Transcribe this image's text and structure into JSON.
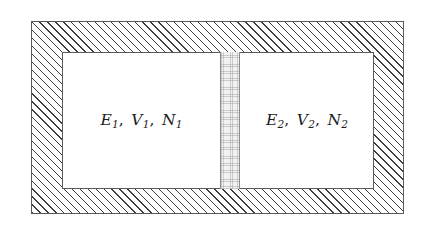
{
  "figure": {
    "background_color": "#ffffff"
  },
  "outer_wall": {
    "name": "insulating outer wall",
    "fill_pattern": "diagonal-hatch-45deg",
    "hatch_color": "#3d3d3d",
    "border_color": "#5a5a5a"
  },
  "inner_cavity": {
    "name": "inner cavity",
    "fill_color": "#ffffff",
    "border_color": "#5a5a5a"
  },
  "partition": {
    "name": "central partition",
    "fill_pattern": "stipple",
    "fill_color": "#f2f2f2",
    "border_color": "#8c8c8c"
  },
  "chambers": [
    {
      "id": "subsystem-1",
      "energy": "E",
      "energy_sub": "1",
      "volume": "V",
      "volume_sub": "1",
      "particles": "N",
      "particles_sub": "1",
      "label_plain": "E1, V1, N1"
    },
    {
      "id": "subsystem-2",
      "energy": "E",
      "energy_sub": "2",
      "volume": "V",
      "volume_sub": "2",
      "particles": "N",
      "particles_sub": "2",
      "label_plain": "E2, V2, N2"
    }
  ]
}
